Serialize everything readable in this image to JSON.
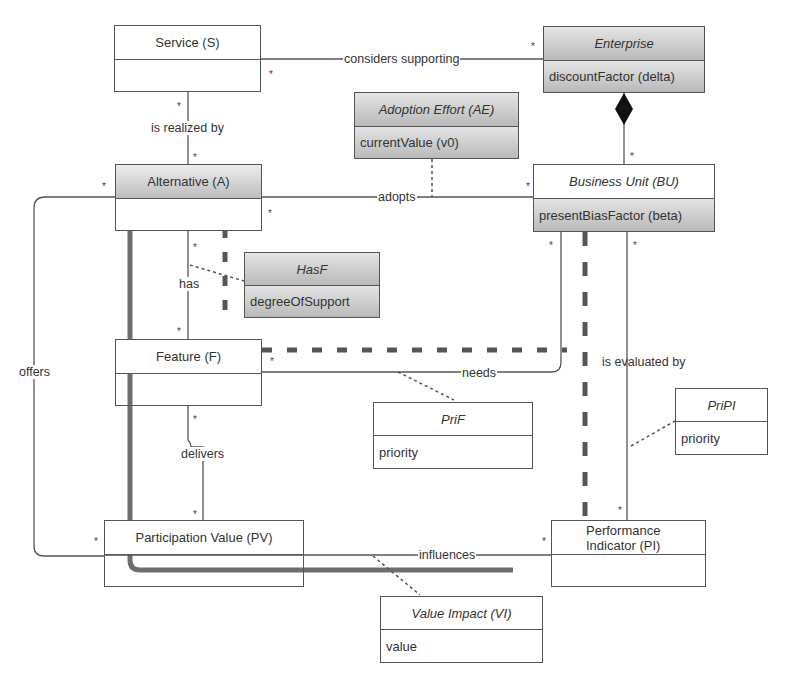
{
  "classes": {
    "service": {
      "name": "Service (S)",
      "attr": ""
    },
    "enterprise": {
      "name": "Enterprise",
      "attr": "discountFactor (delta)"
    },
    "adoption_effort": {
      "name": "Adoption Effort (AE)",
      "attr": "currentValue (v0)"
    },
    "alternative": {
      "name": "Alternative (A)",
      "attr": ""
    },
    "business_unit": {
      "name": "Business Unit (BU)",
      "attr": "presentBiasFactor (beta)"
    },
    "hasf": {
      "name": "HasF",
      "attr": "degreeOfSupport"
    },
    "feature": {
      "name": "Feature (F)",
      "attr": ""
    },
    "prif": {
      "name": "PriF",
      "attr": "priority"
    },
    "pripi": {
      "name": "PriPI",
      "attr": "priority"
    },
    "participation_value": {
      "name": "Participation Value (PV)",
      "attr": ""
    },
    "performance_indicator": {
      "name": "Performance Indicator (PI)",
      "attr": ""
    },
    "value_impact": {
      "name": "Value Impact (VI)",
      "attr": "value"
    }
  },
  "associations": {
    "considers_supporting": "considers supporting",
    "is_realized_by": "is realized by",
    "adopts": "adopts",
    "has": "has",
    "offers": "offers",
    "needs": "needs",
    "is_evaluated_by": "is evaluated by",
    "delivers": "delivers",
    "influences": "influences"
  },
  "multiplicity": "*",
  "colors": {
    "line": "#555555",
    "thick_path": "#6e6e6e",
    "class_border": "#555555",
    "shaded_fill": "#c8c8c8"
  }
}
